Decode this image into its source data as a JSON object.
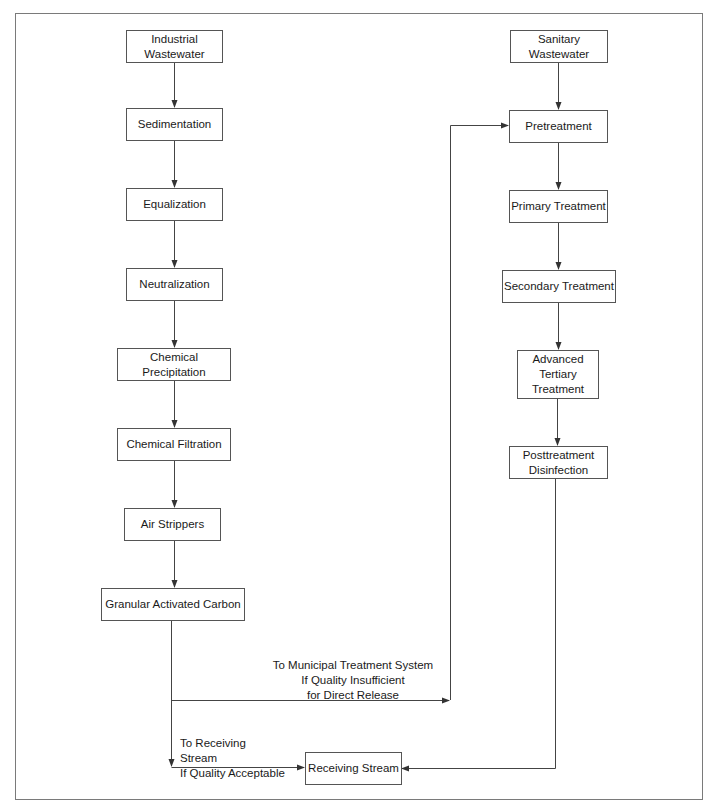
{
  "diagram": {
    "industrial_chain": [
      {
        "id": "industrial",
        "label": "Industrial\nWastewater"
      },
      {
        "id": "sedimentation",
        "label": "Sedimentation"
      },
      {
        "id": "equalization",
        "label": "Equalization"
      },
      {
        "id": "neutralization",
        "label": "Neutralization"
      },
      {
        "id": "chem_precip",
        "label": "Chemical Precipitation"
      },
      {
        "id": "chem_filt",
        "label": "Chemical Filtration"
      },
      {
        "id": "air_strippers",
        "label": "Air Strippers"
      },
      {
        "id": "gac",
        "label": "Granular Activated Carbon"
      }
    ],
    "sanitary_chain": [
      {
        "id": "sanitary",
        "label": "Sanitary\nWastewater"
      },
      {
        "id": "pretreatment",
        "label": "Pretreatment"
      },
      {
        "id": "primary",
        "label": "Primary Treatment"
      },
      {
        "id": "secondary",
        "label": "Secondary Treatment"
      },
      {
        "id": "advanced",
        "label": "Advanced\nTertiary\nTreatment"
      },
      {
        "id": "posttreatment",
        "label": "Posttreatment\nDisinfection"
      }
    ],
    "receiving_stream": {
      "id": "receiving",
      "label": "Receiving Stream"
    },
    "edge_labels": {
      "to_municipal": "To Municipal Treatment System\nIf Quality Insufficient\nfor Direct Release",
      "to_receiving": "To Receiving Stream\nIf Quality Acceptable"
    },
    "line_color": "#444444"
  }
}
